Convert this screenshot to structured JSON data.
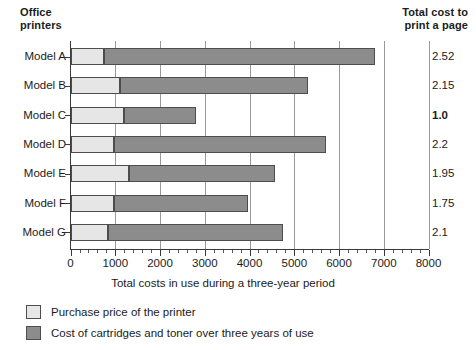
{
  "header": {
    "left_title_line1": "Office",
    "left_title_line2": "printers",
    "right_title_line1": "Total cost to",
    "right_title_line2": "print a page"
  },
  "axis": {
    "x_title": "Total costs in use during a three-year period",
    "x_ticks": [
      "0",
      "1000",
      "2000",
      "3000",
      "4000",
      "5000",
      "6000",
      "7000",
      "8000"
    ]
  },
  "legend": {
    "items": [
      {
        "label": "Purchase price of the printer",
        "color": "#e6e6e6"
      },
      {
        "label": "Cost of cartridges and toner over three years of use",
        "color": "#8c8c8c"
      }
    ]
  },
  "rows": [
    {
      "label": "Model A",
      "purchase": 750,
      "cartridges": 6050,
      "total": 6800,
      "cost_per_page": "2.52",
      "highlight": false
    },
    {
      "label": "Model B",
      "purchase": 1100,
      "cartridges": 4200,
      "total": 5300,
      "cost_per_page": "2.15",
      "highlight": false
    },
    {
      "label": "Model C",
      "purchase": 1200,
      "cartridges": 1600,
      "total": 2800,
      "cost_per_page": "1.0",
      "highlight": true
    },
    {
      "label": "Model D",
      "purchase": 970,
      "cartridges": 4730,
      "total": 5700,
      "cost_per_page": "2.2",
      "highlight": false
    },
    {
      "label": "Model E",
      "purchase": 1300,
      "cartridges": 3270,
      "total": 4570,
      "cost_per_page": "1.95",
      "highlight": false
    },
    {
      "label": "Model F",
      "purchase": 970,
      "cartridges": 3000,
      "total": 3970,
      "cost_per_page": "1.75",
      "highlight": false
    },
    {
      "label": "Model G",
      "purchase": 830,
      "cartridges": 3920,
      "total": 4750,
      "cost_per_page": "2.1",
      "highlight": false
    }
  ],
  "chart_data": {
    "type": "bar",
    "orientation": "horizontal",
    "stacked": true,
    "title": "",
    "xlabel": "Total costs in use during a three-year period",
    "ylabel": "Office printers",
    "xlim": [
      0,
      8000
    ],
    "xticks": [
      0,
      1000,
      2000,
      3000,
      4000,
      5000,
      6000,
      7000,
      8000
    ],
    "grid": "vertical",
    "legend_position": "bottom-left",
    "categories": [
      "Model A",
      "Model B",
      "Model C",
      "Model D",
      "Model E",
      "Model F",
      "Model G"
    ],
    "series": [
      {
        "name": "Purchase price of the printer",
        "color": "#e6e6e6",
        "values": [
          750,
          1100,
          1200,
          970,
          1300,
          970,
          830
        ]
      },
      {
        "name": "Cost of cartridges and toner over three years of use",
        "color": "#8c8c8c",
        "values": [
          6050,
          4200,
          1600,
          4730,
          3270,
          3000,
          3920
        ]
      }
    ],
    "totals": [
      6800,
      5300,
      2800,
      5700,
      4570,
      3970,
      4750
    ],
    "annotations": {
      "column_title": "Total cost to print a page",
      "values": [
        "2.52",
        "2.15",
        "1.0",
        "2.2",
        "1.95",
        "1.75",
        "2.1"
      ],
      "emphasized": [
        "1.0"
      ]
    }
  }
}
